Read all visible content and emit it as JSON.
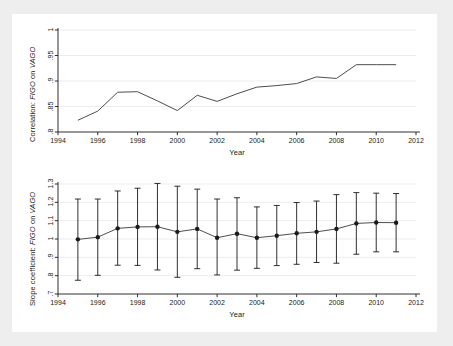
{
  "figure": {
    "background_color": "#eeeeee",
    "panel_color": "#ffffff",
    "line_color": "#4d4d4d",
    "marker_color": "#1a1a1a",
    "axis_color": "#1a1a1a",
    "grid_color": "#e8e8e8"
  },
  "chart_data": [
    {
      "type": "line",
      "id": "correlation-panel",
      "title": "",
      "xlabel": "Year",
      "ylabel": "Correlation: FIGO on VAGO",
      "ylabel_plain": "Correlation: ",
      "ylabel_italic_1": "FIGO",
      "ylabel_mid": " on ",
      "ylabel_italic_2": "VAGO",
      "xlim": [
        1994,
        2012
      ],
      "ylim": [
        0.8,
        1.0
      ],
      "xticks": [
        1994,
        1996,
        1998,
        2000,
        2002,
        2004,
        2006,
        2008,
        2010,
        2012
      ],
      "xticklabels": [
        "1994",
        "1996",
        "1998",
        "2000",
        "2002",
        "2004",
        "2006",
        "2008",
        "2010",
        "2012"
      ],
      "yticks": [
        0.8,
        0.85,
        0.9,
        0.95,
        1.0
      ],
      "yticklabels": [
        ".8",
        ".85",
        ".9",
        ".95",
        "1"
      ],
      "grid": true,
      "legend": "none",
      "x": [
        1995,
        1996,
        1997,
        1998,
        1999,
        2000,
        2001,
        2002,
        2003,
        2004,
        2005,
        2006,
        2007,
        2008,
        2009,
        2010,
        2011
      ],
      "values": [
        0.823,
        0.841,
        0.878,
        0.879,
        0.861,
        0.842,
        0.872,
        0.86,
        0.875,
        0.888,
        0.891,
        0.895,
        0.908,
        0.905,
        0.932,
        0.932,
        0.932
      ]
    },
    {
      "type": "scatter",
      "id": "slope-panel",
      "title": "",
      "xlabel": "Year",
      "ylabel": "Slope coefficient: FIGO on VAGO",
      "ylabel_plain": "Slope coefficient: ",
      "ylabel_italic_1": "FIGO",
      "ylabel_mid": " on ",
      "ylabel_italic_2": "VAGO",
      "xlim": [
        1994,
        2012
      ],
      "ylim": [
        0.7,
        1.3
      ],
      "xticks": [
        1994,
        1996,
        1998,
        2000,
        2002,
        2004,
        2006,
        2008,
        2010,
        2012
      ],
      "xticklabels": [
        "1994",
        "1996",
        "1998",
        "2000",
        "2002",
        "2004",
        "2006",
        "2008",
        "2010",
        "2012"
      ],
      "yticks": [
        0.7,
        0.8,
        0.9,
        1.0,
        1.1,
        1.2,
        1.3
      ],
      "yticklabels": [
        ".7",
        ".8",
        ".9",
        "1",
        "1.1",
        "1.2",
        "1.3"
      ],
      "grid": true,
      "legend": "none",
      "errorbars": true,
      "x": [
        1995,
        1996,
        1997,
        1998,
        1999,
        2000,
        2001,
        2002,
        2003,
        2004,
        2005,
        2006,
        2007,
        2008,
        2009,
        2010,
        2011
      ],
      "values": [
        0.998,
        1.01,
        1.058,
        1.066,
        1.067,
        1.039,
        1.055,
        1.007,
        1.029,
        1.007,
        1.018,
        1.031,
        1.039,
        1.055,
        1.085,
        1.09,
        1.089
      ],
      "ci_low": [
        0.775,
        0.802,
        0.857,
        0.856,
        0.831,
        0.791,
        0.838,
        0.804,
        0.83,
        0.84,
        0.855,
        0.862,
        0.872,
        0.868,
        0.917,
        0.93,
        0.93
      ],
      "ci_high": [
        1.218,
        1.218,
        1.262,
        1.277,
        1.303,
        1.288,
        1.272,
        1.218,
        1.225,
        1.175,
        1.183,
        1.199,
        1.207,
        1.242,
        1.253,
        1.25,
        1.248
      ]
    }
  ]
}
